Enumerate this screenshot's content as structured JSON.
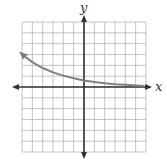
{
  "graph": {
    "x_label": "x",
    "y_label": "y",
    "grid": {
      "cells_x": 12,
      "cells_y": 12,
      "x_min": -6,
      "x_max": 6,
      "y_min": -6,
      "y_max": 6
    },
    "colors": {
      "grid": "#b5b5b5",
      "axes": "#333333",
      "curve": "#808080",
      "background": "#ffffff"
    }
  },
  "chart_data": {
    "type": "line",
    "title": "",
    "xlabel": "x",
    "ylabel": "y",
    "xlim": [
      -6,
      6
    ],
    "ylim": [
      -6,
      6
    ],
    "grid": true,
    "series": [
      {
        "name": "exponential decay curve",
        "x": [
          -6,
          -5,
          -4,
          -3,
          -2,
          -1,
          0,
          1,
          2,
          3,
          4,
          5
        ],
        "y": [
          3.0,
          2.3,
          1.75,
          1.35,
          1.05,
          0.8,
          0.6,
          0.45,
          0.35,
          0.25,
          0.2,
          0.15
        ]
      }
    ],
    "annotations": [
      "arrow at left end of curve (x≈-6)",
      "arrow at right end along x-axis"
    ]
  }
}
